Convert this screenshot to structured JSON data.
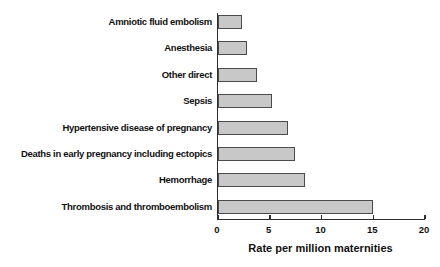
{
  "chart_data": {
    "type": "bar",
    "orientation": "horizontal",
    "title": "",
    "xlabel": "Rate per million maternities",
    "ylabel": "",
    "xlim": [
      0,
      20
    ],
    "xticks": [
      0,
      5,
      10,
      15,
      20
    ],
    "grid": false,
    "legend": false,
    "categories": [
      "Amniotic fluid embolism",
      "Anesthesia",
      "Other direct",
      "Sepsis",
      "Hypertensive disease of pregnancy",
      "Deaths in early pregnancy including ectopics",
      "Hemorrhage",
      "Thrombosis and thromboembolism"
    ],
    "values": [
      2.3,
      2.8,
      3.8,
      5.2,
      6.8,
      7.4,
      8.4,
      15.0
    ],
    "colors": {
      "bar_fill": "#c8c8c8",
      "bar_border": "#4b4b4b",
      "axis": "#2e2e2e",
      "text": "#111111",
      "background": "#ffffff"
    }
  }
}
